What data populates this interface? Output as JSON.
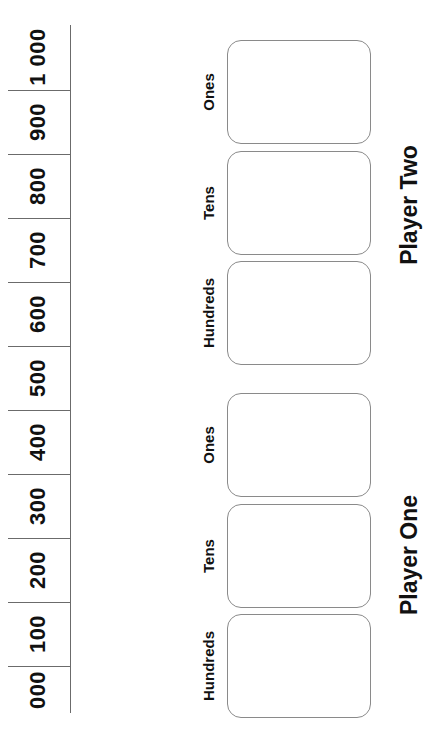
{
  "number_line": {
    "segments": [
      {
        "label": "1 000",
        "center_y": 57
      },
      {
        "label": "900",
        "center_y": 122
      },
      {
        "label": "800",
        "center_y": 186
      },
      {
        "label": "700",
        "center_y": 250
      },
      {
        "label": "600",
        "center_y": 314
      },
      {
        "label": "500",
        "center_y": 378
      },
      {
        "label": "400",
        "center_y": 442
      },
      {
        "label": "300",
        "center_y": 506
      },
      {
        "label": "200",
        "center_y": 570
      },
      {
        "label": "100",
        "center_y": 634
      },
      {
        "label": "000",
        "center_y": 690
      }
    ],
    "divider_ys": [
      90,
      154,
      218,
      282,
      346,
      410,
      474,
      538,
      602,
      666
    ]
  },
  "players": [
    {
      "name": "Player Two",
      "label_center_y": 205,
      "columns": [
        {
          "label": "Ones",
          "top": 40
        },
        {
          "label": "Tens",
          "top": 151
        },
        {
          "label": "Hundreds",
          "top": 261
        }
      ]
    },
    {
      "name": "Player One",
      "label_center_y": 555,
      "columns": [
        {
          "label": "Ones",
          "top": 393
        },
        {
          "label": "Tens",
          "top": 504
        },
        {
          "label": "Hundreds",
          "top": 614
        }
      ]
    }
  ],
  "colors": {
    "line": "#6b6b6b",
    "box_border": "#8a8a8a",
    "text": "#111111"
  }
}
